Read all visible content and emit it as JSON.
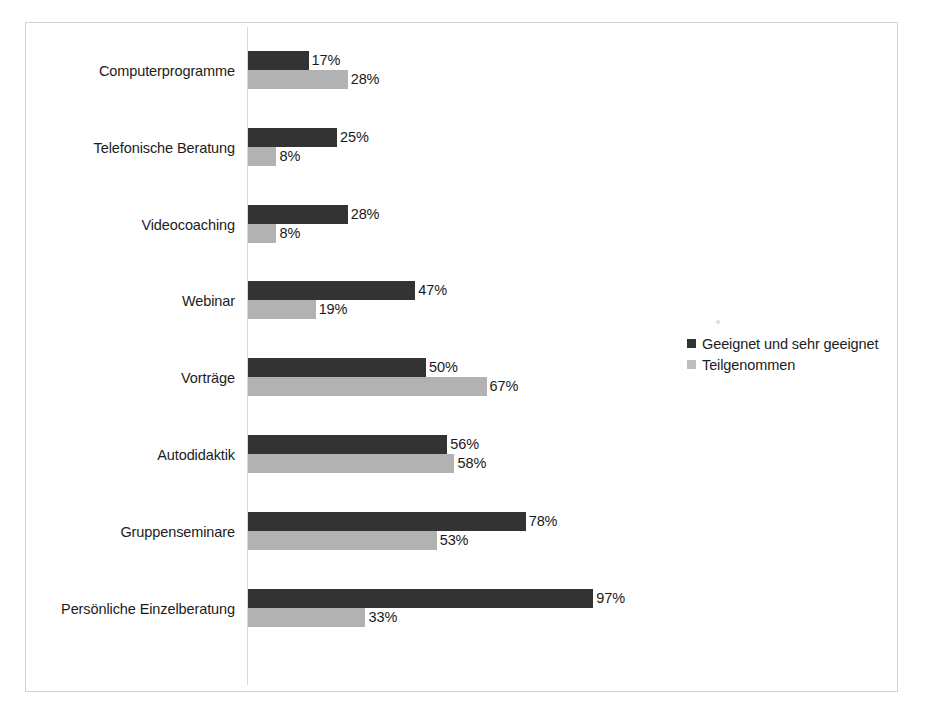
{
  "chart_data": {
    "type": "bar",
    "orientation": "horizontal",
    "title": "",
    "xlabel": "",
    "ylabel": "",
    "xlim": [
      0,
      100
    ],
    "grid": false,
    "legend_position": "right",
    "value_suffix": "%",
    "px_per_unit": 3.56,
    "categories": [
      "Computerprogramme",
      "Telefonische Beratung",
      "Videocoaching",
      "Webinar",
      "Vorträge",
      "Autodidaktik",
      "Gruppenseminare",
      "Persönliche Einzelberatung"
    ],
    "series": [
      {
        "name": "Geeignet und sehr geeignet",
        "color": "#333333",
        "values": [
          17,
          25,
          28,
          47,
          50,
          56,
          78,
          97
        ],
        "labels": [
          "17%",
          "25%",
          "28%",
          "47%",
          "50%",
          "56%",
          "78%",
          "97%"
        ]
      },
      {
        "name": "Teilgenommen",
        "color": "#b2b2b2",
        "values": [
          28,
          8,
          8,
          19,
          67,
          58,
          53,
          33
        ],
        "labels": [
          "28%",
          "8%",
          "8%",
          "19%",
          "67%",
          "58%",
          "53%",
          "33%"
        ]
      }
    ]
  },
  "legend": {
    "entries": [
      {
        "label": "Geeignet und sehr geeignet",
        "swatch": "legend-swatch-dark"
      },
      {
        "label": "Teilgenommen",
        "swatch": "legend-swatch-light"
      }
    ]
  },
  "caption": {
    "text": ""
  }
}
